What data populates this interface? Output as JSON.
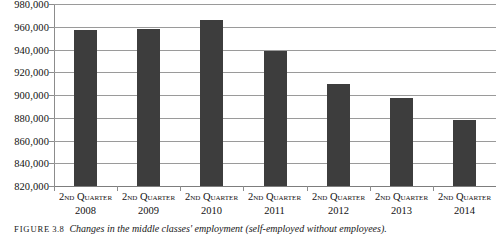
{
  "chart_data": {
    "type": "bar",
    "title": "",
    "subtitle": "",
    "xlabel": "",
    "ylabel": "",
    "categories": [
      "2nd Quarter 2008",
      "2nd Quarter 2009",
      "2nd Quarter 2010",
      "2nd Quarter 2011",
      "2nd Quarter 2012",
      "2nd Quarter 2013",
      "2nd Quarter 2014"
    ],
    "category_parts": [
      {
        "quarter": "2nd Quarter",
        "year": "2008"
      },
      {
        "quarter": "2nd Quarter",
        "year": "2009"
      },
      {
        "quarter": "2nd Quarter",
        "year": "2010"
      },
      {
        "quarter": "2nd Quarter",
        "year": "2011"
      },
      {
        "quarter": "2nd Quarter",
        "year": "2012"
      },
      {
        "quarter": "2nd Quarter",
        "year": "2013"
      },
      {
        "quarter": "2nd Quarter",
        "year": "2014"
      }
    ],
    "values": [
      957000,
      958000,
      966000,
      939000,
      910000,
      897000,
      878000
    ],
    "ylim": [
      820000,
      980000
    ],
    "ytick_step": 20000,
    "ytick_labels": [
      "980,000",
      "960,000",
      "940,000",
      "920,000",
      "900,000",
      "880,000",
      "860,000",
      "840,000",
      "820,000"
    ],
    "ytick_values": [
      980000,
      960000,
      940000,
      920000,
      900000,
      880000,
      860000,
      840000,
      820000
    ],
    "grid": true,
    "legend": "none",
    "bar_color": "#3d3d3d",
    "gridline_color": "#9a9a9a",
    "axis_color": "#8c8c8c",
    "background_color": "#ffffff"
  },
  "caption": {
    "label": "Figure",
    "number": "3.8",
    "text": "Changes in the middle classes' employment (self-employed without employees)."
  }
}
